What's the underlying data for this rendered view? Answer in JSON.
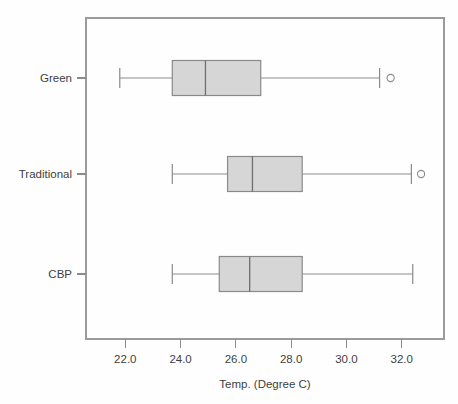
{
  "chart_data": {
    "type": "box",
    "title": "",
    "subtitle": "",
    "xlabel": "Temp. (Degree C)",
    "ylabel": "",
    "orientation": "horizontal",
    "grid": false,
    "legend": null,
    "xlim": [
      20.8,
      33.5
    ],
    "xticks": [
      22.0,
      24.0,
      26.0,
      28.0,
      30.0,
      32.0
    ],
    "xtick_labels": [
      "22.0",
      "24.0",
      "26.0",
      "28.0",
      "30.0",
      "32.0"
    ],
    "categories": [
      "Green",
      "Traditional",
      "CBP"
    ],
    "category_order_top_to_bottom": [
      "Green",
      "Traditional",
      "CBP"
    ],
    "boxes": [
      {
        "name": "Green",
        "whisker_low": 21.8,
        "q1": 23.7,
        "median": 24.9,
        "q3": 26.9,
        "whisker_high": 31.2,
        "outliers": [
          31.6
        ]
      },
      {
        "name": "Traditional",
        "whisker_low": 23.7,
        "q1": 25.7,
        "median": 26.6,
        "q3": 28.4,
        "whisker_high": 32.35,
        "outliers": [
          32.7
        ]
      },
      {
        "name": "CBP",
        "whisker_low": 23.7,
        "q1": 25.4,
        "median": 26.5,
        "q3": 28.4,
        "whisker_high": 32.4,
        "outliers": []
      }
    ],
    "colors": {
      "box_fill": "#d6d6d6",
      "box_stroke": "#8a8a8a",
      "median": "#6f6f6f",
      "whisker": "#8a8a8a",
      "outlier": "#8a8a8a",
      "frame": "#9a9a9a",
      "text": "#3f3f3f",
      "background": "#fefefe"
    }
  },
  "axis": {
    "x_title": "Temp. (Degree C)"
  }
}
